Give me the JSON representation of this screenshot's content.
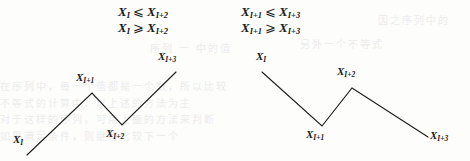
{
  "page": {
    "width": 470,
    "height": 161,
    "background_color": "#fdfdfc",
    "ink_color": "#1b1b1b",
    "bleed_color": "#ececec"
  },
  "formulas": {
    "rows": [
      {
        "left": {
          "lhs": "X",
          "lhs_sub": "I",
          "relation": "⩽",
          "rhs": "X",
          "rhs_sub": "I+2"
        },
        "right": {
          "lhs": "X",
          "lhs_sub": "I+1",
          "relation": "⩽",
          "rhs": "X",
          "rhs_sub": "I+3"
        }
      },
      {
        "left": {
          "lhs": "X",
          "lhs_sub": "I",
          "relation": "⩾",
          "rhs": "X",
          "rhs_sub": "I+2"
        },
        "right": {
          "lhs": "X",
          "lhs_sub": "I+1",
          "relation": "⩾",
          "rhs": "X",
          "rhs_sub": "I+3"
        }
      }
    ]
  },
  "diagrams": [
    {
      "id": "left",
      "shape": "up-down-up",
      "polyline": "27,155 92,93 122,125 176,72",
      "vertices": [
        {
          "name": "X",
          "sub": "I",
          "x": 27,
          "y": 155,
          "label_x": 13,
          "label_y": 134,
          "role": "start"
        },
        {
          "name": "X",
          "sub": "I+1",
          "x": 92,
          "y": 93,
          "label_x": 76,
          "label_y": 72,
          "role": "peak"
        },
        {
          "name": "X",
          "sub": "I+2",
          "x": 122,
          "y": 125,
          "label_x": 106,
          "label_y": 128,
          "role": "valley"
        },
        {
          "name": "X",
          "sub": "I+3",
          "x": 176,
          "y": 72,
          "label_x": 158,
          "label_y": 51,
          "role": "end"
        }
      ]
    },
    {
      "id": "right",
      "shape": "down-up-down",
      "polyline": "262,72 322,126 352,88 428,137",
      "vertices": [
        {
          "name": "X",
          "sub": "I",
          "x": 262,
          "y": 72,
          "label_x": 256,
          "label_y": 51,
          "role": "start"
        },
        {
          "name": "X",
          "sub": "I+1",
          "x": 322,
          "y": 126,
          "label_x": 306,
          "label_y": 129,
          "role": "valley"
        },
        {
          "name": "X",
          "sub": "I+2",
          "x": 352,
          "y": 88,
          "label_x": 337,
          "label_y": 66,
          "role": "peak"
        },
        {
          "name": "X",
          "sub": "I+3",
          "x": 428,
          "y": 137,
          "label_x": 430,
          "label_y": 130,
          "role": "end"
        }
      ]
    }
  ],
  "bleed_through": [
    {
      "text": "因之序列中的",
      "x": 378,
      "y": 12
    },
    {
      "text": "序列 一 中的值",
      "x": 150,
      "y": 40
    },
    {
      "text": "另外一个不等式",
      "x": 300,
      "y": 36
    },
    {
      "text": "在序列中，每一个值都是一个数，所以比较",
      "x": 0,
      "y": 78
    },
    {
      "text": "不等式的计算中，以上述的方法为主",
      "x": 0,
      "y": 95
    },
    {
      "text": "对于这样的序列，可用上面的方法来判断",
      "x": 0,
      "y": 111
    },
    {
      "text": "如果满足条件，则继续比较下一个",
      "x": 0,
      "y": 128
    }
  ]
}
